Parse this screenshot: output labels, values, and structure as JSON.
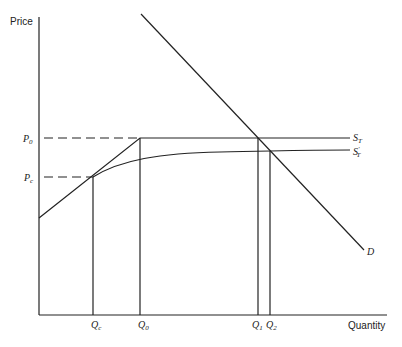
{
  "diagram": {
    "type": "economics-supply-demand",
    "axes": {
      "y_label": "Price",
      "x_label": "Quantity"
    },
    "price_levels": [
      {
        "id": "P0",
        "main": "P",
        "sub": "0"
      },
      {
        "id": "Pc",
        "main": "P",
        "sub": "c"
      }
    ],
    "quantity_levels": [
      {
        "id": "Qc",
        "main": "Q",
        "sub": "c"
      },
      {
        "id": "Q0",
        "main": "Q",
        "sub": "0"
      },
      {
        "id": "Q1",
        "main": "Q",
        "sub": "1"
      },
      {
        "id": "Q2",
        "main": "Q",
        "sub": "2"
      }
    ],
    "curves": [
      {
        "id": "ST",
        "main": "S",
        "sub": "T",
        "prime": ""
      },
      {
        "id": "ST_prime",
        "main": "S",
        "sub": "T",
        "prime": "′"
      },
      {
        "id": "D",
        "main": "D"
      }
    ],
    "colors": {
      "line": "#222222",
      "background": "#ffffff"
    }
  }
}
